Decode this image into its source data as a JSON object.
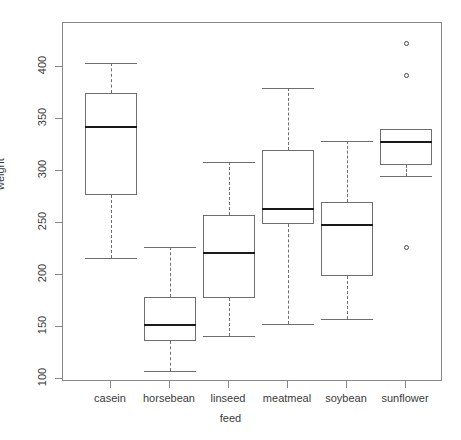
{
  "chart_data": {
    "type": "box",
    "title": "",
    "xlabel": "feed",
    "ylabel": "weight",
    "categories": [
      "casein",
      "horsebean",
      "linseed",
      "meatmeal",
      "soybean",
      "sunflower"
    ],
    "ylim": [
      94,
      430
    ],
    "yticks": [
      100,
      150,
      200,
      250,
      300,
      350,
      400
    ],
    "ytick_labels": [
      "100",
      "150",
      "200",
      "250",
      "300",
      "350",
      "400"
    ],
    "grid": false,
    "legend": "none",
    "boxes": [
      {
        "category": "casein",
        "whisker_low": 216,
        "q1": 277,
        "median": 342,
        "q3": 375,
        "whisker_high": 404,
        "outliers": []
      },
      {
        "category": "horsebean",
        "whisker_low": 108,
        "q1": 137,
        "median": 151.5,
        "q3": 179,
        "whisker_high": 227,
        "outliers": []
      },
      {
        "category": "linseed",
        "whisker_low": 141,
        "q1": 178,
        "median": 221,
        "q3": 257.5,
        "whisker_high": 309,
        "outliers": []
      },
      {
        "category": "meatmeal",
        "whisker_low": 153,
        "q1": 249,
        "median": 263,
        "q3": 320,
        "whisker_high": 380,
        "outliers": []
      },
      {
        "category": "soybean",
        "whisker_low": 158,
        "q1": 199,
        "median": 248,
        "q3": 270,
        "whisker_high": 329,
        "outliers": []
      },
      {
        "category": "sunflower",
        "whisker_low": 295,
        "q1": 306,
        "median": 328,
        "q3": 340,
        "whisker_high": 340,
        "outliers": [
          423,
          392,
          226
        ]
      }
    ]
  },
  "style": {
    "frame_color": "#888888",
    "box_color": "#6e6e6e",
    "median_color": "#1a1a1a",
    "text_color": "#3b3b3b",
    "background": "#ffffff"
  }
}
